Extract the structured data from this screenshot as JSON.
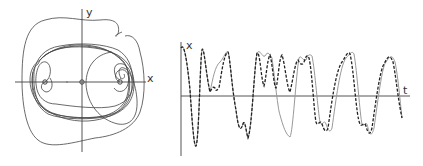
{
  "phase_portrait": {
    "x_axis_label": "x",
    "y_axis_label": "y",
    "colors": {
      "axis": "#555555",
      "curve": "#444444"
    }
  },
  "time_series": {
    "x_axis_label": "t",
    "y_axis_label": "x",
    "series": [
      {
        "name": "solid",
        "style": "solid",
        "color": "#999999"
      },
      {
        "name": "dashed",
        "style": "dashed",
        "color": "#222222"
      }
    ]
  }
}
